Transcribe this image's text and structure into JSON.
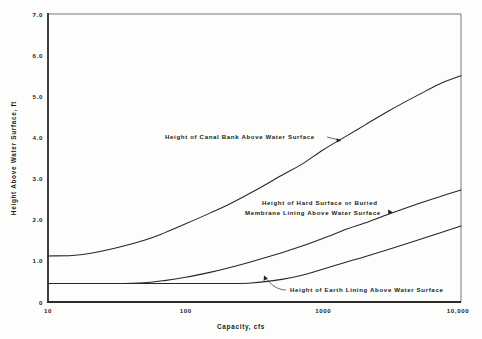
{
  "figure": {
    "background_color": "#fdfdfb",
    "line_color": "#262626",
    "frame_color": "#555555"
  },
  "chart_data": {
    "type": "line",
    "title": "",
    "subtitle": "",
    "xlabel": "Capacity, cfs",
    "ylabel": "Height Above Water Surface, ft",
    "xscale": "log",
    "yscale": "linear",
    "xlim": [
      10,
      10000
    ],
    "ylim": [
      0,
      7.0
    ],
    "grid": false,
    "legend_position": "inline-annotations",
    "xticks": [
      10,
      100,
      1000,
      10000
    ],
    "xtick_labels": [
      "10",
      "100",
      "1000",
      "10,000"
    ],
    "yticks": [
      0,
      1.0,
      2.0,
      3.0,
      4.0,
      5.0,
      6.0,
      7.0
    ],
    "ytick_labels": [
      "0",
      "1.0",
      "2.0",
      "3.0",
      "4.0",
      "5.0",
      "6.0",
      "7.0"
    ],
    "x": [
      10,
      15,
      20,
      30,
      50,
      70,
      100,
      150,
      200,
      300,
      500,
      700,
      1000,
      1500,
      2000,
      3000,
      5000,
      7000,
      10000
    ],
    "series": [
      {
        "name": "Height of Canal Bank Above Water Surface",
        "values": [
          1.12,
          1.13,
          1.18,
          1.3,
          1.5,
          1.68,
          1.9,
          2.16,
          2.35,
          2.66,
          3.08,
          3.35,
          3.7,
          4.05,
          4.3,
          4.65,
          5.05,
          5.3,
          5.5
        ]
      },
      {
        "name": "Height of Hard Surface or Buried Membrane Lining Above Water Surface",
        "values": [
          0.45,
          0.45,
          0.45,
          0.45,
          0.47,
          0.52,
          0.6,
          0.72,
          0.82,
          0.98,
          1.2,
          1.36,
          1.55,
          1.78,
          1.92,
          2.14,
          2.4,
          2.56,
          2.72
        ]
      },
      {
        "name": "Height of Earth Lining Above Water Surface",
        "values": [
          0.45,
          0.45,
          0.45,
          0.45,
          0.45,
          0.45,
          0.45,
          0.45,
          0.45,
          0.46,
          0.55,
          0.65,
          0.8,
          0.98,
          1.1,
          1.28,
          1.52,
          1.68,
          1.85
        ]
      }
    ],
    "annotations": [
      {
        "id": "canal-bank",
        "lines": [
          "Height of Canal Bank Above Water Surface"
        ],
        "points_to_x": 1450,
        "points_to_y": 3.95
      },
      {
        "id": "hard-surface",
        "lines": [
          "Height of Hard Surface or Buried",
          "Membrane Lining Above Water Surface"
        ],
        "points_to_x": 3300,
        "points_to_y": 2.2
      },
      {
        "id": "earth-lining",
        "lines": [
          "Height of Earth Lining Above Water Surface"
        ],
        "points_to_x": 380,
        "points_to_y": 0.47
      }
    ]
  }
}
